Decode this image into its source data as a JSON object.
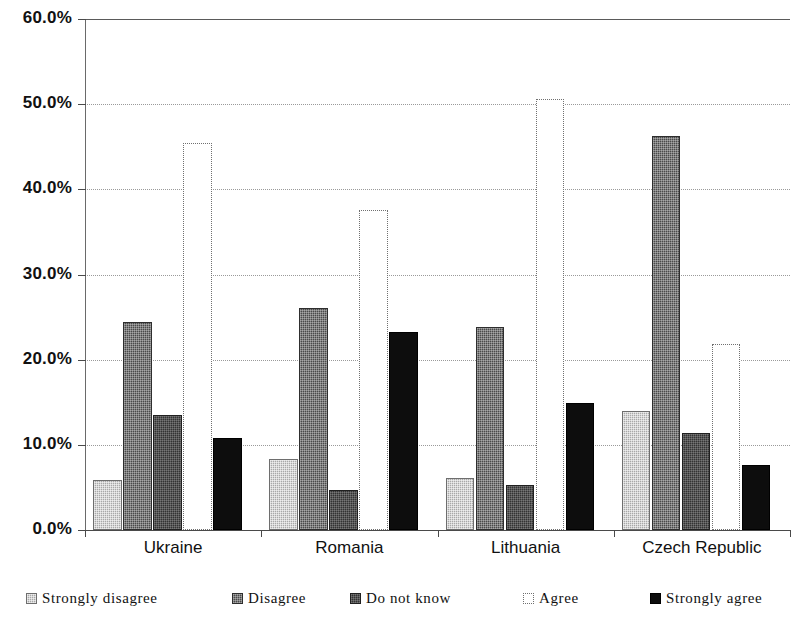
{
  "chart_data": {
    "type": "bar",
    "title": "",
    "xlabel": "",
    "ylabel": "",
    "ylim": [
      0,
      60
    ],
    "ytick_labels": [
      "0.0%",
      "10.0%",
      "20.0%",
      "30.0%",
      "40.0%",
      "50.0%",
      "60.0%"
    ],
    "ytick_values": [
      0,
      10,
      20,
      30,
      40,
      50,
      60
    ],
    "grid": true,
    "legend_position": "bottom",
    "categories": [
      "Ukraine",
      "Romania",
      "Lithuania",
      "Czech Republic"
    ],
    "series": [
      {
        "name": "Strongly disagree",
        "key": "sd",
        "color": "#a8a8a8",
        "values": [
          5.9,
          8.3,
          6.1,
          14.0
        ]
      },
      {
        "name": "Disagree",
        "key": "d",
        "color": "#4a4a4a",
        "values": [
          24.4,
          26.1,
          23.8,
          46.3
        ]
      },
      {
        "name": "Do not know",
        "key": "dnk",
        "color": "#333333",
        "values": [
          13.5,
          4.7,
          5.3,
          11.4
        ]
      },
      {
        "name": "Agree",
        "key": "a",
        "color": "#ffffff",
        "values": [
          45.4,
          37.6,
          50.6,
          21.9
        ]
      },
      {
        "name": "Strongly agree",
        "key": "sa",
        "color": "#0d0d0d",
        "values": [
          10.8,
          23.2,
          14.9,
          7.6
        ]
      }
    ]
  },
  "legend": {
    "items": [
      {
        "label": "Strongly disagree",
        "swatch": "pattern-light-gray"
      },
      {
        "label": "Disagree",
        "swatch": "pattern-dark-gray"
      },
      {
        "label": "Do not know",
        "swatch": "pattern-darker-gray"
      },
      {
        "label": "Agree",
        "swatch": "outline-white"
      },
      {
        "label": "Strongly agree",
        "swatch": "solid-black"
      }
    ]
  }
}
